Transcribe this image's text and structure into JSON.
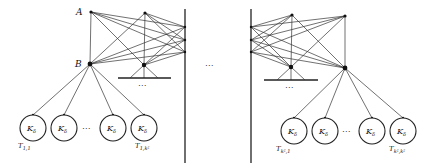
{
  "diagram": {
    "left": {
      "node_A": "A",
      "node_B": "B",
      "ellipsis_base": "⋯",
      "ellipsis_circles": "⋯",
      "cliques": [
        "K",
        "K",
        "K",
        "K"
      ],
      "clique_sub": "δ",
      "t_first": {
        "main": "T",
        "sub": "1,1"
      },
      "t_last": {
        "main": "T",
        "sub": "1,k²"
      }
    },
    "center_ellipsis": "⋯",
    "right": {
      "ellipsis_base": "⋯",
      "ellipsis_circles": "⋯",
      "cliques": [
        "K",
        "K",
        "K",
        "K"
      ],
      "clique_sub": "δ",
      "t_first": {
        "main": "T",
        "sub": "k²,1"
      },
      "t_last": {
        "main": "T",
        "sub": "k²,k²"
      }
    }
  }
}
